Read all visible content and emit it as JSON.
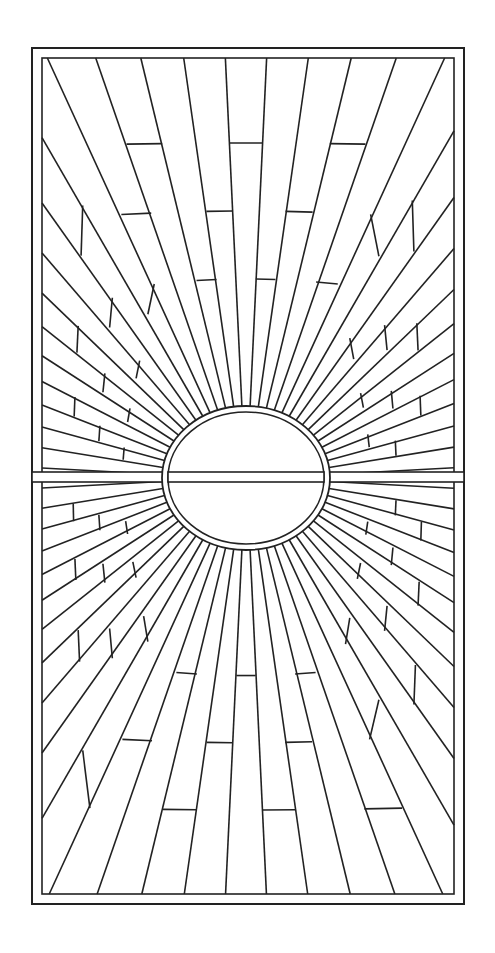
{
  "artwork": {
    "subject": "stained glass sunburst pattern",
    "style": "black line drawing on white",
    "colors": {
      "line": "#222222",
      "background": "#ffffff"
    },
    "frame": {
      "x": 32,
      "y": 48,
      "width": 432,
      "height": 856
    },
    "sun": {
      "cx": 246,
      "cy": 478,
      "rx": 80,
      "ry": 68
    },
    "ray_count": 64
  }
}
